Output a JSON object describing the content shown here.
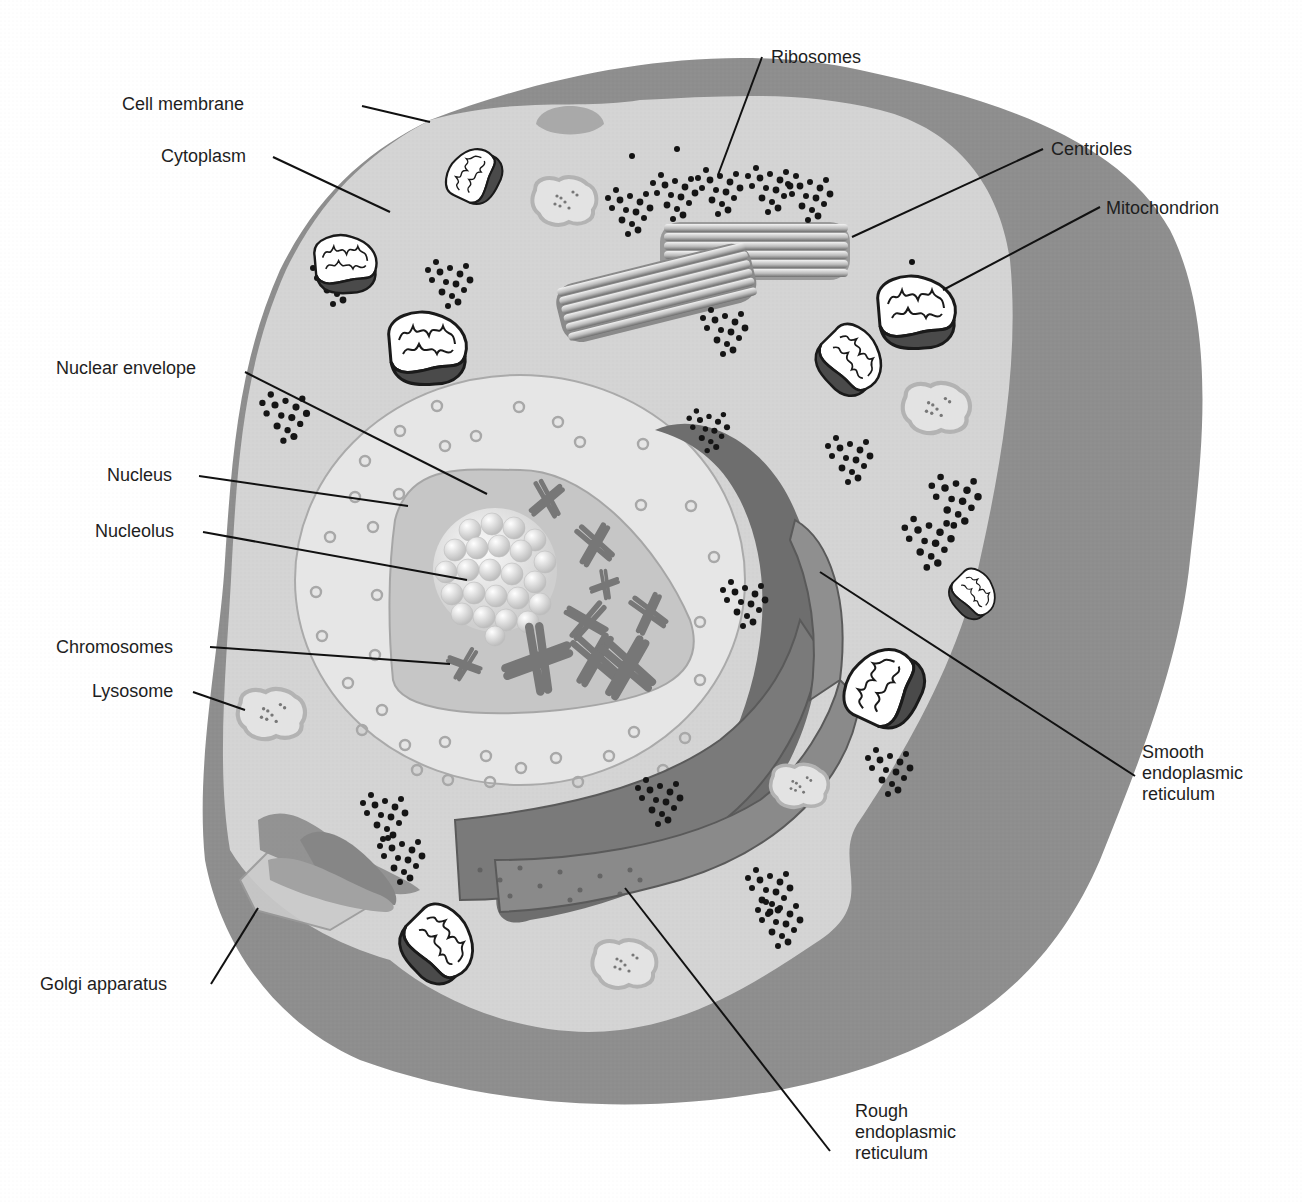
{
  "diagram": {
    "colors": {
      "background": "#ffffff",
      "cell_outer": "#8e8e8e",
      "cytoplasm": "#d4d4d4",
      "nuclear_envelope": "#e6e6e6",
      "nucleus": "#c6c6c6",
      "er": "#6e6e6e",
      "ribosome": "#111111",
      "mitochondrion_dark": "#4a4a4a",
      "lysosome": "#bdbdbd",
      "text": "#1e1e1e"
    },
    "labels": {
      "cell_membrane": "Cell membrane",
      "cytoplasm": "Cytoplasm",
      "ribosomes": "Ribosomes",
      "centrioles": "Centrioles",
      "mitochondrion": "Mitochondrion",
      "nuclear_envelope": "Nuclear envelope",
      "nucleus": "Nucleus",
      "nucleolus": "Nucleolus",
      "chromosomes": "Chromosomes",
      "lysosome": "Lysosome",
      "golgi": "Golgi apparatus",
      "smooth_er": [
        "Smooth",
        "endoplasmic",
        "reticulum"
      ],
      "rough_er": [
        "Rough",
        "endoplasmic",
        "reticulum"
      ]
    }
  }
}
